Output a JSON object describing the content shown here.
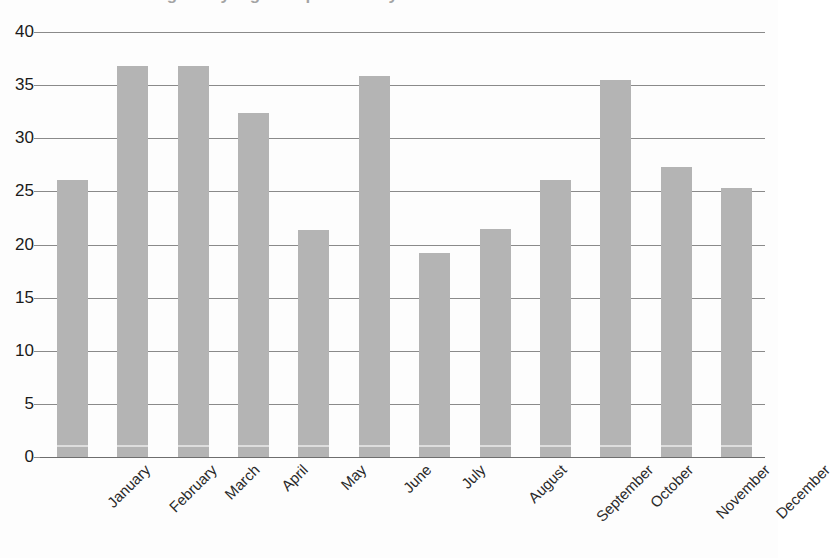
{
  "title": {
    "text": "Average daily high temperature by month",
    "clipped": true
  },
  "chart_data": {
    "type": "bar",
    "title": "Average daily high temperature by month",
    "xlabel": "",
    "ylabel": "",
    "categories": [
      "January",
      "February",
      "March",
      "April",
      "May",
      "June",
      "July",
      "August",
      "September",
      "October",
      "November",
      "December"
    ],
    "values": [
      26.1,
      36.8,
      36.8,
      32.4,
      21.4,
      35.9,
      19.2,
      21.5,
      26.1,
      35.5,
      27.3,
      25.3
    ],
    "ylim": [
      0,
      40
    ],
    "yticks": [
      0,
      5,
      10,
      15,
      20,
      25,
      30,
      35,
      40
    ],
    "ytick_labels": [
      "0",
      "5",
      "10",
      "15",
      "20",
      "25",
      "30",
      "35",
      "40"
    ],
    "grid": true,
    "grid_axis": "y",
    "legend": false,
    "legend_position": "none",
    "bar_color": "#b4b4b4",
    "gridline_color": "#8a8a8a",
    "xtick_rotation": -45
  },
  "colors": {
    "bar": "#b4b4b4",
    "gridline": "#8a8a8a",
    "baseline": "#6e6e6e",
    "text": "#1a1a1a",
    "background": "#fdfdfd"
  }
}
